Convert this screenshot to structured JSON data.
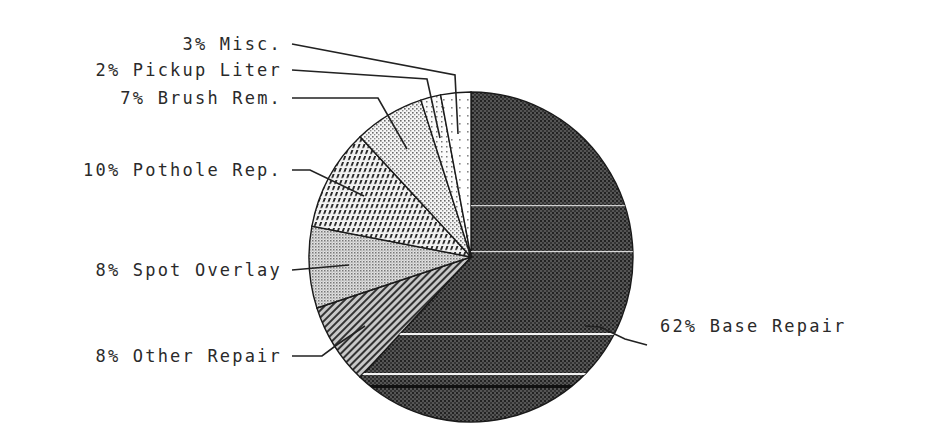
{
  "chart_data": {
    "type": "pie",
    "title": "",
    "start_angle_deg": 0,
    "direction": "clockwise",
    "slices": [
      {
        "label": "Base Repair",
        "value": 62,
        "text": "62% Base Repair",
        "fill": "#3a3a3a"
      },
      {
        "label": "Other Repair",
        "value": 8,
        "text": "8% Other Repair",
        "fill": "#8a8a8a"
      },
      {
        "label": "Spot Overlay",
        "value": 8,
        "text": "8% Spot Overlay",
        "fill": "#b4b4b4"
      },
      {
        "label": "Pothole Rep.",
        "value": 10,
        "text": "10% Pothole Rep.",
        "fill": "#9a9a9a"
      },
      {
        "label": "Brush Rem.",
        "value": 7,
        "text": "7% Brush Rem.",
        "fill": "#d6d6d6"
      },
      {
        "label": "Pickup Liter",
        "value": 2,
        "text": "2% Pickup Liter",
        "fill": "#e6e6e6"
      },
      {
        "label": "Misc.",
        "value": 3,
        "text": "3% Misc.",
        "fill": "#f0f0f0"
      }
    ],
    "legend": "none (callout labels with leader lines)"
  },
  "labels": {
    "misc": "3% Misc.",
    "pickup": "2% Pickup Liter",
    "brush": "7% Brush Rem.",
    "pothole": "10% Pothole Rep.",
    "spot": "8% Spot Overlay",
    "other": "8% Other Repair",
    "base": "62% Base Repair"
  }
}
